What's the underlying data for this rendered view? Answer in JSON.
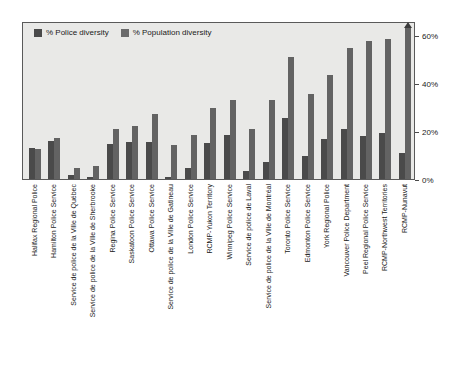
{
  "chart_data": {
    "type": "bar",
    "title": "",
    "subtitle": "",
    "xlabel": "",
    "ylabel": "",
    "ylim": [
      0,
      65
    ],
    "grid": false,
    "legend_position": "top-left",
    "ytick_labels": [
      "0%",
      "20%",
      "40%",
      "60%"
    ],
    "ytick_values": [
      0,
      20,
      40,
      60
    ],
    "categories": [
      "Halifax Regional Police",
      "Hamilton Police Service",
      "Service de police de la Ville de Québec",
      "Service de police de la Ville de Sherbrooke",
      "Regina Police Service",
      "Saskatoon Police Service",
      "Ottawa Police Service",
      "Service de police de la Ville de Gatineau",
      "London Police Service",
      "RCMP-Yukon Territory",
      "Winnipeg Police Service",
      "Service de police de Laval",
      "Service de police de la Ville de Montréal",
      "Toronto Police Service",
      "Edmonton Police Service",
      "York Regional Police",
      "Vancouver Police Department",
      "Peel Regional Police Service",
      "RCMP-Northwest Territories",
      "RCMP-Nunavut"
    ],
    "series": [
      {
        "name": "% Police diversity",
        "color": "#4a4a4a",
        "values": [
          13,
          16,
          1.5,
          1,
          14.5,
          15.5,
          15.5,
          1,
          4.5,
          15,
          18.5,
          3.5,
          7,
          25.5,
          9.5,
          16.5,
          21,
          18,
          19,
          11
        ]
      },
      {
        "name": "% Population diversity",
        "color": "#636363",
        "values": [
          12.5,
          17,
          4.5,
          5.5,
          21,
          22,
          27,
          14,
          18.5,
          29.5,
          33,
          21,
          33,
          51,
          35.5,
          43.5,
          54.5,
          57.5,
          58.5,
          63
        ]
      }
    ],
    "annotations": [
      {
        "category": "RCMP-Nunavut",
        "series": "% Population diversity",
        "marker": "up-arrow",
        "meaning": "value exceeds axis range"
      }
    ]
  },
  "legend": {
    "entries": [
      {
        "label": "% Police diversity",
        "color": "#4a4a4a"
      },
      {
        "label": "% Population diversity",
        "color": "#636363"
      }
    ]
  }
}
